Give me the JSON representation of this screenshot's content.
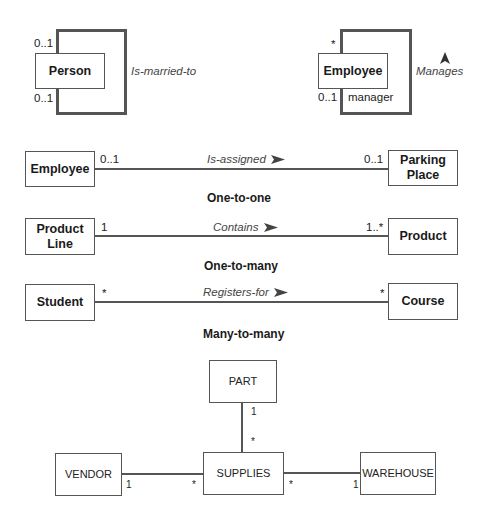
{
  "unary": {
    "person": {
      "entity": "Person",
      "relationship": "Is-married-to",
      "mult_top": "0..1",
      "mult_bottom": "0..1"
    },
    "employee": {
      "entity": "Employee",
      "relationship": "Manages",
      "mult_top": "*",
      "mult_bottom": "0..1",
      "role": "manager",
      "arrow": "up-arrow-icon"
    }
  },
  "binary": [
    {
      "left": "Employee",
      "right": "Parking Place",
      "right_line1": "Parking",
      "right_line2": "Place",
      "relationship": "Is-assigned",
      "left_mult": "0..1",
      "right_mult": "0..1",
      "caption": "One-to-one"
    },
    {
      "left": "Product Line",
      "left_line1": "Product",
      "left_line2": "Line",
      "right": "Product",
      "relationship": "Contains",
      "left_mult": "1",
      "right_mult": "1..*",
      "caption": "One-to-many"
    },
    {
      "left": "Student",
      "right": "Course",
      "relationship": "Registers-for",
      "left_mult": "*",
      "right_mult": "*",
      "caption": "Many-to-many"
    }
  ],
  "ternary": {
    "center": "SUPPLIES",
    "top": "PART",
    "left": "VENDOR",
    "right": "WAREHOUSE",
    "part_mult_near_part": "1",
    "part_mult_near_supplies": "*",
    "vendor_mult_near_vendor": "1",
    "vendor_mult_near_supplies": "*",
    "warehouse_mult_near_supplies": "*",
    "warehouse_mult_near_warehouse": "1"
  },
  "colors": {
    "line": "#555555",
    "text": "#222222",
    "relationship_text": "#444444"
  }
}
